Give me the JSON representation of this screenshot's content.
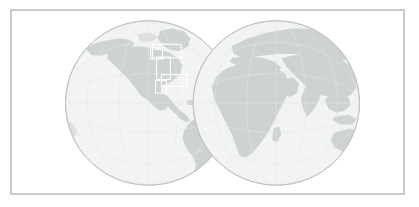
{
  "widget": {
    "name": "world-locator-map",
    "title": "World Locator Map",
    "description": "Two-hemisphere orthographic world map with highlighted extent boxes over North America and the Caribbean"
  },
  "frame": {
    "border_color": "#c9cacb",
    "border_width_px": 2,
    "background": "#ffffff"
  },
  "colors": {
    "ocean": "#f2f3f3",
    "land": "#cfd2d3",
    "land_light": "#dcdedf",
    "globe_outline": "#b9bbbc",
    "highlight_stroke": "#ffffff",
    "graticule": "#e6e7e8"
  },
  "globes": [
    {
      "id": "western-hemisphere",
      "label": "Western Hemisphere",
      "center_x": 148,
      "center_y": 103,
      "radius": 84,
      "regions": [
        "North America",
        "South America",
        "Greenland",
        "Antarctica"
      ]
    },
    {
      "id": "eastern-hemisphere",
      "label": "Eastern Hemisphere",
      "center_x": 277,
      "center_y": 103,
      "radius": 84,
      "regions": [
        "Europe",
        "Africa",
        "Asia",
        "Australia",
        "Antarctica"
      ]
    }
  ],
  "highlight_boxes": [
    {
      "id": "extent-box-north-america-upper",
      "label": "North America upper extent",
      "x": 152,
      "y": 43,
      "width": 29,
      "height": 14
    },
    {
      "id": "extent-box-north-america-west",
      "label": "North America west extent",
      "x": 150,
      "y": 48,
      "width": 12,
      "height": 10
    },
    {
      "id": "extent-box-north-america-lower",
      "label": "North America lower extent",
      "x": 156,
      "y": 56,
      "width": 14,
      "height": 23
    },
    {
      "id": "extent-box-caribbean",
      "label": "Caribbean extent",
      "x": 161,
      "y": 74,
      "width": 26,
      "height": 12
    },
    {
      "id": "extent-box-central-america",
      "label": "Central America extent",
      "x": 155,
      "y": 80,
      "width": 11,
      "height": 13
    }
  ]
}
